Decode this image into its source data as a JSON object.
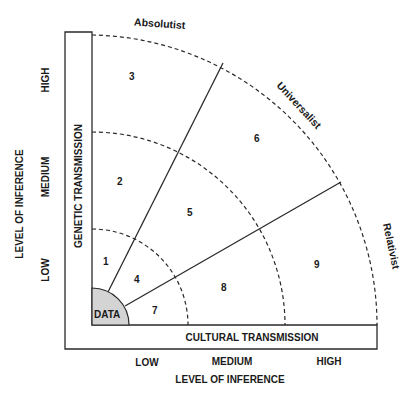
{
  "diagram": {
    "arc_labels": {
      "absolutist": "Absolutist",
      "universalist": "Universalist",
      "relativist": "Relativist"
    },
    "axes": {
      "vertical_title": "LEVEL OF INFERENCE",
      "vertical_ticks": [
        "LOW",
        "MEDIUM",
        "HIGH"
      ],
      "vertical_bar_label": "GENETIC TRANSMISSION",
      "horizontal_title": "LEVEL OF INFERENCE",
      "horizontal_ticks": [
        "LOW",
        "MEDIUM",
        "HIGH"
      ],
      "horizontal_bar_label": "CULTURAL TRANSMISSION"
    },
    "center_label": "DATA",
    "regions": [
      "1",
      "2",
      "3",
      "4",
      "5",
      "6",
      "7",
      "8",
      "9"
    ],
    "colors": {
      "data_fill": "#d4d4d4",
      "line": "#2a2a2a"
    }
  }
}
